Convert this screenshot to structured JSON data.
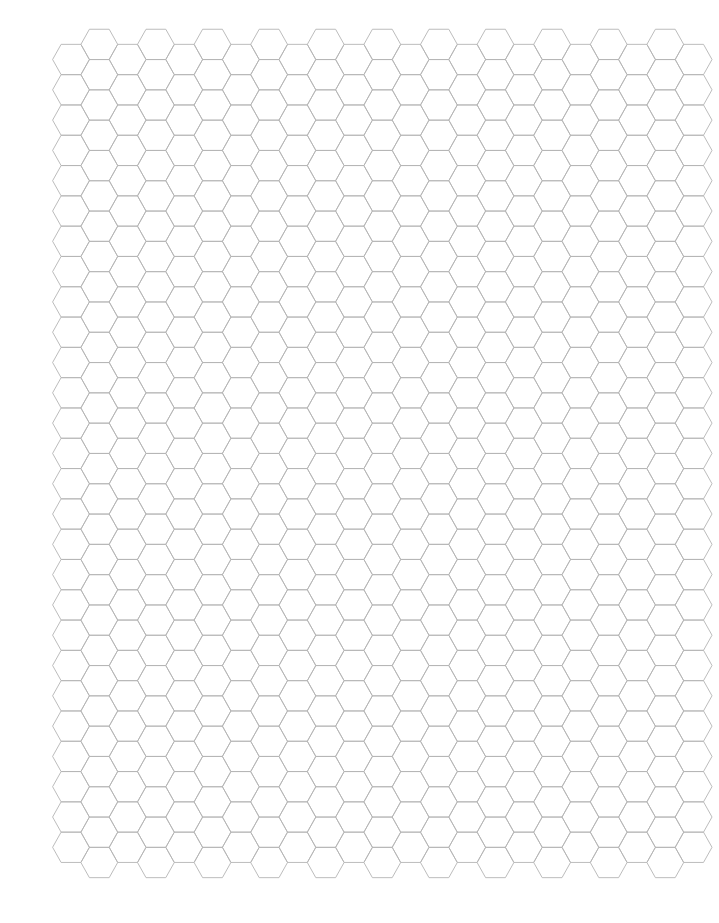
{
  "page": {
    "width": 719,
    "height": 923,
    "background": "#ffffff"
  },
  "hex_grid": {
    "orientation": "flat-top",
    "line_color": "#b4b4b4",
    "columns": 23,
    "first_column_center_x": 71,
    "column_spacing": 28.3,
    "half_width": 18.4,
    "top_edge_half_length": 9.9,
    "row_pitch": 30.3,
    "low_columns": {
      "parity": "even",
      "first_center_y": 59.5,
      "rows": 27
    },
    "high_columns": {
      "parity": "odd",
      "first_center_y": 44.4,
      "rows": 28
    }
  }
}
